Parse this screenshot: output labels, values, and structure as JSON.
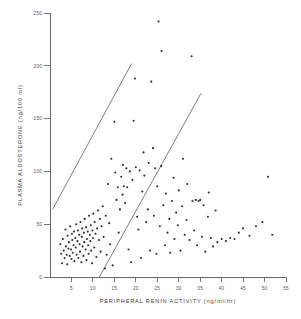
{
  "chart_data": {
    "type": "scatter",
    "title": "",
    "xlabel": "PERIPHERAL RENIN ACTIVITY (ng/ml/hr)",
    "ylabel": "PLASMA ALDOSTERONE (ng/100 ml)",
    "xlim": [
      0,
      55
    ],
    "ylim": [
      0,
      250
    ],
    "xticks": [
      5,
      10,
      15,
      20,
      25,
      30,
      35,
      40,
      45,
      50,
      55
    ],
    "yticks": [
      0,
      50,
      100,
      150,
      200,
      250
    ],
    "xtick_labels": [
      "5",
      "10",
      "15",
      "20",
      "25",
      "30",
      "35",
      "40",
      "45",
      "50",
      "55"
    ],
    "ytick_labels": [
      "0",
      "50",
      "100",
      "150",
      "200",
      "250"
    ],
    "grid": false,
    "legend": null,
    "marker": "point",
    "marker_color": "#2b2f33",
    "line_color": "#6b7176",
    "annotation_lines": [
      {
        "name": "upper-boundary-line",
        "x": [
          0.6,
          19.0
        ],
        "y": [
          64.0,
          202.0
        ]
      },
      {
        "name": "lower-boundary-line",
        "x": [
          11.5,
          35.2
        ],
        "y": [
          0.0,
          174.0
        ]
      }
    ],
    "points": [
      {
        "x": 2.4,
        "y": 31.0
      },
      {
        "x": 2.6,
        "y": 22.0
      },
      {
        "x": 2.8,
        "y": 13.0
      },
      {
        "x": 3.0,
        "y": 36.0
      },
      {
        "x": 3.2,
        "y": 25.0
      },
      {
        "x": 3.4,
        "y": 18.0
      },
      {
        "x": 3.6,
        "y": 45.0
      },
      {
        "x": 3.7,
        "y": 29.0
      },
      {
        "x": 3.9,
        "y": 21.0
      },
      {
        "x": 4.0,
        "y": 12.0
      },
      {
        "x": 4.1,
        "y": 39.0
      },
      {
        "x": 4.3,
        "y": 27.0
      },
      {
        "x": 4.4,
        "y": 33.0
      },
      {
        "x": 4.6,
        "y": 20.0
      },
      {
        "x": 4.7,
        "y": 48.0
      },
      {
        "x": 4.9,
        "y": 26.0
      },
      {
        "x": 5.0,
        "y": 17.0
      },
      {
        "x": 5.1,
        "y": 41.0
      },
      {
        "x": 5.2,
        "y": 35.0
      },
      {
        "x": 5.3,
        "y": 23.0
      },
      {
        "x": 5.5,
        "y": 30.0
      },
      {
        "x": 5.6,
        "y": 43.0
      },
      {
        "x": 5.7,
        "y": 15.0
      },
      {
        "x": 5.9,
        "y": 37.0
      },
      {
        "x": 6.0,
        "y": 28.0
      },
      {
        "x": 6.1,
        "y": 50.0
      },
      {
        "x": 6.2,
        "y": 21.0
      },
      {
        "x": 6.4,
        "y": 34.0
      },
      {
        "x": 6.5,
        "y": 44.0
      },
      {
        "x": 6.6,
        "y": 18.0
      },
      {
        "x": 6.8,
        "y": 40.0
      },
      {
        "x": 6.9,
        "y": 31.0
      },
      {
        "x": 7.0,
        "y": 24.0
      },
      {
        "x": 7.1,
        "y": 52.0
      },
      {
        "x": 7.3,
        "y": 14.0
      },
      {
        "x": 7.4,
        "y": 38.0
      },
      {
        "x": 7.5,
        "y": 46.0
      },
      {
        "x": 7.6,
        "y": 29.0
      },
      {
        "x": 7.8,
        "y": 20.0
      },
      {
        "x": 7.9,
        "y": 42.0
      },
      {
        "x": 8.0,
        "y": 33.0
      },
      {
        "x": 8.1,
        "y": 55.0
      },
      {
        "x": 8.3,
        "y": 26.0
      },
      {
        "x": 8.4,
        "y": 47.0
      },
      {
        "x": 8.5,
        "y": 16.0
      },
      {
        "x": 8.6,
        "y": 36.0
      },
      {
        "x": 8.8,
        "y": 43.0
      },
      {
        "x": 8.9,
        "y": 30.0
      },
      {
        "x": 9.0,
        "y": 22.0
      },
      {
        "x": 9.1,
        "y": 58.0
      },
      {
        "x": 9.3,
        "y": 40.0
      },
      {
        "x": 9.4,
        "y": 34.0
      },
      {
        "x": 9.5,
        "y": 49.0
      },
      {
        "x": 9.6,
        "y": 25.0
      },
      {
        "x": 9.8,
        "y": 13.0
      },
      {
        "x": 9.9,
        "y": 44.0
      },
      {
        "x": 10.0,
        "y": 37.0
      },
      {
        "x": 10.1,
        "y": 60.0
      },
      {
        "x": 10.3,
        "y": 28.0
      },
      {
        "x": 10.4,
        "y": 52.0
      },
      {
        "x": 10.6,
        "y": 41.0
      },
      {
        "x": 10.8,
        "y": 19.0
      },
      {
        "x": 11.0,
        "y": 46.0
      },
      {
        "x": 11.2,
        "y": 63.0
      },
      {
        "x": 11.4,
        "y": 35.0
      },
      {
        "x": 11.6,
        "y": 55.0
      },
      {
        "x": 11.8,
        "y": 24.0
      },
      {
        "x": 12.0,
        "y": 48.0
      },
      {
        "x": 12.3,
        "y": 67.0
      },
      {
        "x": 12.5,
        "y": 38.0
      },
      {
        "x": 12.8,
        "y": 8.0
      },
      {
        "x": 13.0,
        "y": 58.0
      },
      {
        "x": 13.2,
        "y": 21.0
      },
      {
        "x": 13.5,
        "y": 88.0
      },
      {
        "x": 13.8,
        "y": 51.0
      },
      {
        "x": 14.0,
        "y": 31.0
      },
      {
        "x": 14.3,
        "y": 112.0
      },
      {
        "x": 14.6,
        "y": 11.0
      },
      {
        "x": 15.0,
        "y": 147.0
      },
      {
        "x": 15.2,
        "y": 99.0
      },
      {
        "x": 15.5,
        "y": 73.0
      },
      {
        "x": 15.8,
        "y": 85.0
      },
      {
        "x": 16.0,
        "y": 42.0
      },
      {
        "x": 16.3,
        "y": 64.0
      },
      {
        "x": 16.6,
        "y": 95.0
      },
      {
        "x": 16.9,
        "y": 78.0
      },
      {
        "x": 17.0,
        "y": 106.0
      },
      {
        "x": 17.2,
        "y": 86.0
      },
      {
        "x": 17.5,
        "y": 70.0
      },
      {
        "x": 17.8,
        "y": 103.0
      },
      {
        "x": 18.0,
        "y": 85.0
      },
      {
        "x": 18.3,
        "y": 26.0
      },
      {
        "x": 18.6,
        "y": 100.0
      },
      {
        "x": 18.9,
        "y": 14.0
      },
      {
        "x": 19.2,
        "y": 92.0
      },
      {
        "x": 19.5,
        "y": 148.0
      },
      {
        "x": 19.8,
        "y": 188.0
      },
      {
        "x": 20.0,
        "y": 104.0
      },
      {
        "x": 20.3,
        "y": 57.0
      },
      {
        "x": 20.6,
        "y": 45.0
      },
      {
        "x": 20.9,
        "y": 101.0
      },
      {
        "x": 21.2,
        "y": 18.0
      },
      {
        "x": 21.5,
        "y": 81.0
      },
      {
        "x": 21.8,
        "y": 118.0
      },
      {
        "x": 22.0,
        "y": 96.0
      },
      {
        "x": 22.4,
        "y": 52.0
      },
      {
        "x": 22.8,
        "y": 64.0
      },
      {
        "x": 23.0,
        "y": 108.0
      },
      {
        "x": 23.3,
        "y": 25.0
      },
      {
        "x": 23.6,
        "y": 185.0
      },
      {
        "x": 24.0,
        "y": 122.0
      },
      {
        "x": 24.2,
        "y": 58.0
      },
      {
        "x": 24.5,
        "y": 103.0
      },
      {
        "x": 24.8,
        "y": 22.0
      },
      {
        "x": 25.0,
        "y": 86.0
      },
      {
        "x": 25.3,
        "y": 242.0
      },
      {
        "x": 25.6,
        "y": 48.0
      },
      {
        "x": 25.9,
        "y": 105.0
      },
      {
        "x": 26.0,
        "y": 214.0
      },
      {
        "x": 26.4,
        "y": 68.0
      },
      {
        "x": 26.8,
        "y": 30.0
      },
      {
        "x": 27.0,
        "y": 79.0
      },
      {
        "x": 27.4,
        "y": 42.0
      },
      {
        "x": 27.8,
        "y": 55.0
      },
      {
        "x": 28.0,
        "y": 23.0
      },
      {
        "x": 28.4,
        "y": 72.0
      },
      {
        "x": 28.8,
        "y": 94.0
      },
      {
        "x": 29.0,
        "y": 36.0
      },
      {
        "x": 29.4,
        "y": 61.0
      },
      {
        "x": 29.8,
        "y": 49.0
      },
      {
        "x": 30.0,
        "y": 82.0
      },
      {
        "x": 30.4,
        "y": 25.0
      },
      {
        "x": 30.8,
        "y": 67.0
      },
      {
        "x": 31.0,
        "y": 112.0
      },
      {
        "x": 31.4,
        "y": 40.0
      },
      {
        "x": 31.8,
        "y": 54.0
      },
      {
        "x": 32.0,
        "y": 88.0
      },
      {
        "x": 32.5,
        "y": 35.0
      },
      {
        "x": 33.0,
        "y": 209.0
      },
      {
        "x": 33.2,
        "y": 72.0
      },
      {
        "x": 33.6,
        "y": 44.0
      },
      {
        "x": 34.0,
        "y": 73.0
      },
      {
        "x": 34.3,
        "y": 30.0
      },
      {
        "x": 34.6,
        "y": 72.0
      },
      {
        "x": 35.0,
        "y": 73.0
      },
      {
        "x": 35.4,
        "y": 38.0
      },
      {
        "x": 35.8,
        "y": 68.0
      },
      {
        "x": 36.2,
        "y": 24.0
      },
      {
        "x": 36.8,
        "y": 57.0
      },
      {
        "x": 37.0,
        "y": 80.0
      },
      {
        "x": 37.5,
        "y": 37.0
      },
      {
        "x": 38.0,
        "y": 29.0
      },
      {
        "x": 38.6,
        "y": 63.0
      },
      {
        "x": 39.0,
        "y": 33.0
      },
      {
        "x": 40.0,
        "y": 36.0
      },
      {
        "x": 41.0,
        "y": 34.0
      },
      {
        "x": 42.0,
        "y": 37.0
      },
      {
        "x": 43.0,
        "y": 36.0
      },
      {
        "x": 44.0,
        "y": 42.0
      },
      {
        "x": 45.0,
        "y": 46.0
      },
      {
        "x": 46.5,
        "y": 39.0
      },
      {
        "x": 48.0,
        "y": 48.0
      },
      {
        "x": 49.5,
        "y": 52.0
      },
      {
        "x": 50.8,
        "y": 95.0
      },
      {
        "x": 51.8,
        "y": 40.0
      }
    ]
  }
}
